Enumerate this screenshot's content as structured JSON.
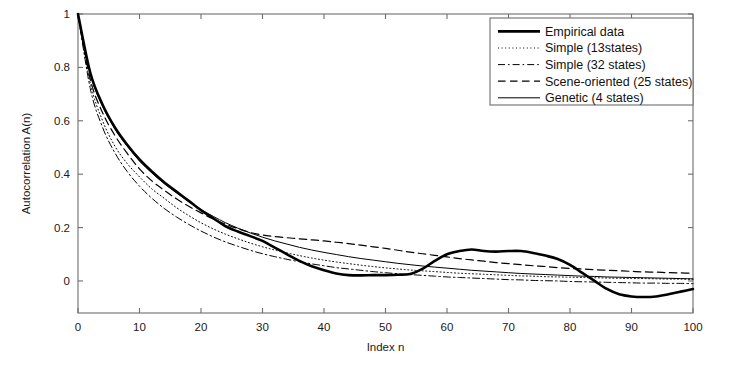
{
  "chart_data": {
    "type": "line",
    "title": "",
    "xlabel": "Index n",
    "ylabel": "Autocorrelation A(n)",
    "xlim": [
      0,
      100
    ],
    "ylim": [
      -0.12,
      1.0
    ],
    "xticks": [
      0,
      10,
      20,
      30,
      40,
      50,
      60,
      70,
      80,
      90,
      100
    ],
    "xticklabels": [
      "0",
      "10",
      "20",
      "30",
      "40",
      "50",
      "60",
      "70",
      "80",
      "90",
      "100"
    ],
    "yticks": [
      0,
      0.2,
      0.4,
      0.6,
      0.8,
      1
    ],
    "yticklabels": [
      "0",
      "0.2",
      "0.4",
      "0.6",
      "0.8",
      "1"
    ],
    "grid": false,
    "legend_position": "upper right",
    "box": true,
    "x": [
      0,
      2,
      4,
      6,
      8,
      10,
      12,
      14,
      16,
      18,
      20,
      22,
      24,
      26,
      28,
      30,
      32,
      34,
      36,
      38,
      40,
      42,
      44,
      46,
      48,
      50,
      52,
      54,
      56,
      58,
      60,
      62,
      64,
      66,
      68,
      70,
      72,
      74,
      76,
      78,
      80,
      82,
      84,
      86,
      88,
      90,
      92,
      94,
      96,
      98,
      100
    ],
    "series": [
      {
        "name": "Empirical data",
        "style": "solid-thick",
        "linewidth": 2.6,
        "color": "#000000",
        "values": [
          1.0,
          0.78,
          0.66,
          0.575,
          0.51,
          0.455,
          0.41,
          0.37,
          0.335,
          0.3,
          0.265,
          0.235,
          0.205,
          0.185,
          0.168,
          0.15,
          0.125,
          0.1,
          0.075,
          0.055,
          0.04,
          0.028,
          0.022,
          0.021,
          0.022,
          0.022,
          0.023,
          0.026,
          0.045,
          0.075,
          0.1,
          0.112,
          0.118,
          0.112,
          0.11,
          0.112,
          0.112,
          0.105,
          0.095,
          0.082,
          0.06,
          0.03,
          0.0,
          -0.03,
          -0.05,
          -0.058,
          -0.06,
          -0.058,
          -0.05,
          -0.04,
          -0.03
        ]
      },
      {
        "name": "Simple (13states)",
        "style": "dotted",
        "linewidth": 1.0,
        "color": "#000000",
        "values": [
          1.0,
          0.74,
          0.6,
          0.505,
          0.44,
          0.39,
          0.345,
          0.31,
          0.275,
          0.245,
          0.218,
          0.195,
          0.175,
          0.158,
          0.142,
          0.128,
          0.116,
          0.105,
          0.095,
          0.086,
          0.078,
          0.071,
          0.065,
          0.059,
          0.054,
          0.049,
          0.045,
          0.041,
          0.038,
          0.035,
          0.032,
          0.029,
          0.027,
          0.025,
          0.023,
          0.021,
          0.019,
          0.018,
          0.016,
          0.015,
          0.014,
          0.013,
          0.012,
          0.011,
          0.01,
          0.009,
          0.009,
          0.008,
          0.007,
          0.007,
          0.006
        ]
      },
      {
        "name": "Simple (32 states)",
        "style": "dashdot",
        "linewidth": 1.0,
        "color": "#000000",
        "values": [
          1.0,
          0.72,
          0.575,
          0.48,
          0.41,
          0.355,
          0.31,
          0.272,
          0.24,
          0.212,
          0.187,
          0.165,
          0.146,
          0.13,
          0.115,
          0.102,
          0.091,
          0.081,
          0.072,
          0.064,
          0.057,
          0.05,
          0.045,
          0.04,
          0.035,
          0.031,
          0.027,
          0.024,
          0.021,
          0.018,
          0.015,
          0.013,
          0.011,
          0.009,
          0.007,
          0.005,
          0.004,
          0.002,
          0.001,
          0.0,
          -0.002,
          -0.003,
          -0.004,
          -0.005,
          -0.006,
          -0.007,
          -0.008,
          -0.008,
          -0.009,
          -0.009,
          -0.01
        ]
      },
      {
        "name": "Scene-oriented (25 states)",
        "style": "dashed",
        "linewidth": 1.2,
        "color": "#000000",
        "values": [
          1.0,
          0.755,
          0.63,
          0.545,
          0.478,
          0.42,
          0.375,
          0.34,
          0.308,
          0.28,
          0.255,
          0.232,
          0.213,
          0.196,
          0.182,
          0.172,
          0.166,
          0.162,
          0.158,
          0.154,
          0.15,
          0.145,
          0.14,
          0.134,
          0.128,
          0.122,
          0.115,
          0.108,
          0.102,
          0.096,
          0.09,
          0.084,
          0.079,
          0.074,
          0.069,
          0.065,
          0.061,
          0.057,
          0.054,
          0.05,
          0.047,
          0.045,
          0.042,
          0.04,
          0.038,
          0.036,
          0.034,
          0.033,
          0.031,
          0.03,
          0.029
        ]
      },
      {
        "name": "Genetic (4 states)",
        "style": "solid-thin",
        "linewidth": 1.0,
        "color": "#000000",
        "values": [
          1.0,
          0.775,
          0.655,
          0.57,
          0.505,
          0.45,
          0.405,
          0.365,
          0.33,
          0.298,
          0.268,
          0.242,
          0.218,
          0.198,
          0.18,
          0.164,
          0.15,
          0.138,
          0.126,
          0.116,
          0.107,
          0.099,
          0.091,
          0.084,
          0.078,
          0.072,
          0.066,
          0.061,
          0.056,
          0.052,
          0.048,
          0.044,
          0.04,
          0.037,
          0.034,
          0.031,
          0.028,
          0.026,
          0.024,
          0.022,
          0.02,
          0.018,
          0.017,
          0.015,
          0.014,
          0.013,
          0.012,
          0.011,
          0.01,
          0.009,
          0.008
        ]
      }
    ]
  }
}
